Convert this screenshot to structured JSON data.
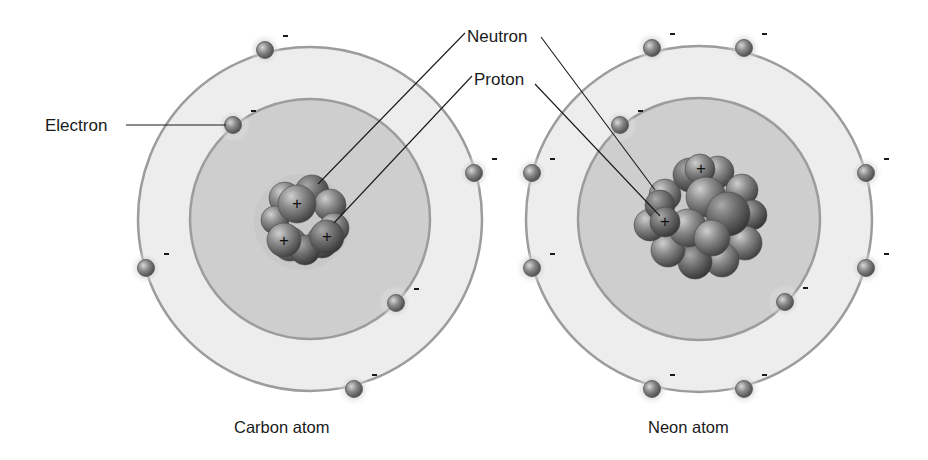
{
  "labels": {
    "electron": "Electron",
    "neutron": "Neutron",
    "proton": "Proton"
  },
  "captions": {
    "carbon": "Carbon atom",
    "neon": "Neon atom"
  },
  "symbols": {
    "electron_charge": "-",
    "proton_charge": "+"
  },
  "colors": {
    "background": "#ffffff",
    "outer_shell_fill": "#ededed",
    "inner_shell_fill": "#cecece",
    "shell_stroke": "#9c9c9c",
    "electron_fill": "#7a7a7a",
    "nucleon_fill": "#6a6a6a",
    "leader_line": "#1a1a1a",
    "text": "#1a1a1a"
  },
  "atoms": [
    {
      "id": "carbon",
      "name": "Carbon atom",
      "center": [
        310,
        219
      ],
      "outer_radius": 172,
      "inner_radius": 120,
      "electron_count": 6,
      "proton_count_visible": 3,
      "electrons": [
        [
          265,
          50
        ],
        [
          233,
          125
        ],
        [
          474,
          173
        ],
        [
          146,
          268
        ],
        [
          396,
          303
        ],
        [
          354,
          389
        ]
      ],
      "nucleus": {
        "center": [
          302,
          218
        ],
        "spheres": [
          [
            285,
            198,
            16
          ],
          [
            312,
            192,
            17
          ],
          [
            330,
            205,
            16
          ],
          [
            275,
            220,
            14
          ],
          [
            322,
            242,
            16
          ],
          [
            290,
            244,
            17
          ],
          [
            334,
            228,
            15
          ],
          [
            305,
            250,
            15
          ],
          [
            297,
            204,
            19
          ],
          [
            284,
            240,
            17
          ],
          [
            327,
            237,
            17
          ]
        ],
        "protons": [
          [
            297,
            204
          ],
          [
            284,
            241
          ],
          [
            327,
            237
          ]
        ]
      }
    },
    {
      "id": "neon",
      "name": "Neon atom",
      "center": [
        699,
        219
      ],
      "outer_radius": 173,
      "inner_radius": 121,
      "electron_count": 10,
      "proton_count_visible": 2,
      "electrons": [
        [
          652,
          48
        ],
        [
          744,
          48
        ],
        [
          620,
          125
        ],
        [
          532,
          173
        ],
        [
          866,
          173
        ],
        [
          532,
          268
        ],
        [
          866,
          268
        ],
        [
          785,
          302
        ],
        [
          652,
          389
        ],
        [
          744,
          389
        ]
      ],
      "nucleus": {
        "center": [
          703,
          216
        ],
        "spheres": [
          [
            665,
            195,
            16
          ],
          [
            690,
            175,
            17
          ],
          [
            718,
            172,
            16
          ],
          [
            742,
            190,
            16
          ],
          [
            752,
            215,
            15
          ],
          [
            745,
            243,
            17
          ],
          [
            722,
            260,
            17
          ],
          [
            695,
            262,
            17
          ],
          [
            668,
            250,
            17
          ],
          [
            650,
            225,
            16
          ],
          [
            660,
            205,
            15
          ],
          [
            700,
            169,
            15
          ],
          [
            706,
            197,
            20
          ],
          [
            728,
            214,
            22
          ],
          [
            688,
            228,
            19
          ],
          [
            712,
            238,
            18
          ],
          [
            665,
            222,
            15
          ]
        ],
        "protons": [
          [
            701,
            169
          ],
          [
            665,
            222
          ]
        ]
      }
    }
  ],
  "leader_lines": [
    {
      "label": "electron",
      "points": [
        [
          126,
          125
        ],
        [
          226,
          125
        ]
      ]
    },
    {
      "label": "neutron-carbon",
      "points": [
        [
          465,
          33
        ],
        [
          318,
          184
        ]
      ]
    },
    {
      "label": "proton-carbon",
      "points": [
        [
          472,
          76
        ],
        [
          334,
          223
        ]
      ]
    },
    {
      "label": "neutron-neon",
      "points": [
        [
          541,
          37
        ],
        [
          655,
          190
        ]
      ]
    },
    {
      "label": "proton-neon",
      "points": [
        [
          535,
          84
        ],
        [
          660,
          216
        ]
      ]
    }
  ]
}
